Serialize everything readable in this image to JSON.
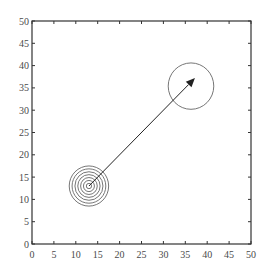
{
  "chart_data": {
    "type": "scatter",
    "title": "",
    "xlabel": "",
    "ylabel": "",
    "xlim": [
      0,
      50
    ],
    "ylim": [
      0,
      50
    ],
    "grid": false,
    "legend": null,
    "x_ticks": [
      0,
      5,
      10,
      15,
      20,
      25,
      30,
      35,
      40,
      45,
      50
    ],
    "y_ticks": [
      0,
      5,
      10,
      15,
      20,
      25,
      30,
      35,
      40,
      45,
      50
    ],
    "concentric_circles": {
      "center": [
        13,
        13
      ],
      "radii": [
        0.6,
        1.25,
        1.9,
        2.55,
        3.2,
        3.85,
        4.5
      ]
    },
    "target_circle": {
      "center": [
        36.3,
        35.4
      ],
      "radius": 5.2
    },
    "arrow": {
      "from": [
        13,
        13
      ],
      "to": [
        37.2,
        37.2
      ]
    }
  },
  "colors": {
    "axis": "#333333",
    "circles": "#666666",
    "arrow": "#222222",
    "tick_label": "#4a4a4a"
  }
}
